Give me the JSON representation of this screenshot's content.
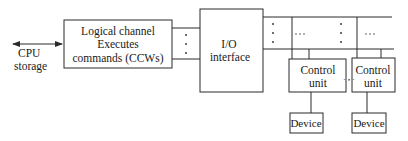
{
  "diagram": {
    "cpu_storage": {
      "line1": "CPU",
      "line2": "storage"
    },
    "logical_channel": {
      "line1": "Logical channel",
      "line2": "Executes",
      "line3": "commands (CCWs)"
    },
    "io_interface": {
      "line1": "I/O",
      "line2": "interface"
    },
    "control_units": [
      {
        "line1": "Control",
        "line2": "unit"
      },
      {
        "line1": "Control",
        "line2": "unit"
      }
    ],
    "devices": [
      {
        "label": "Device"
      },
      {
        "label": "Device"
      }
    ],
    "ellipsis": "· · ·"
  }
}
